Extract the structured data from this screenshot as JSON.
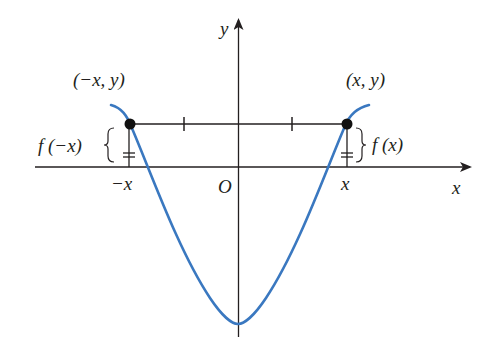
{
  "figure": {
    "colors": {
      "curve": "#3a78c0",
      "axes": "#231f20",
      "points": "#111111",
      "background": "#ffffff"
    },
    "axes": {
      "x_label": "x",
      "y_label": "y",
      "origin_label": "O"
    },
    "tick_labels": {
      "neg_x": "−x",
      "pos_x": "x"
    },
    "points": [
      {
        "name": "left-point",
        "label": "(−x, y)"
      },
      {
        "name": "right-point",
        "label": "(x, y)"
      }
    ],
    "brace_labels": {
      "left": "f (−x)",
      "right": "f (x)"
    }
  }
}
